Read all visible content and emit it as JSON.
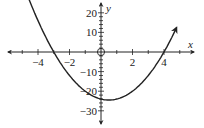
{
  "chart_data": {
    "type": "line",
    "title": "",
    "xlabel": "x",
    "ylabel": "y",
    "function": "y = 2(x + 3)(x - 4)",
    "xlim": [
      -5.3,
      5.3
    ],
    "ylim": [
      -33,
      25
    ],
    "x_ticks": [
      -4,
      -2,
      2,
      4
    ],
    "x_tick_labels": [
      "−4",
      "−2",
      "2",
      "4"
    ],
    "y_ticks": [
      20,
      10,
      -10,
      -20,
      -30
    ],
    "y_tick_labels": [
      "20",
      "10",
      "−10",
      "−20",
      "−30"
    ],
    "grid": false,
    "legend": null,
    "series": [
      {
        "name": "parabola",
        "x": [
          -4.8,
          -4,
          -3,
          -2,
          -1,
          0,
          0.5,
          1,
          2,
          3,
          4,
          4.8
        ],
        "y": [
          21.6,
          16,
          0,
          -12,
          -20,
          -24,
          -24.5,
          -24,
          -20,
          -12,
          0,
          12.5
        ]
      }
    ],
    "annotations": [
      "open circle at origin",
      "arrows on axis ends and curve ends"
    ]
  }
}
